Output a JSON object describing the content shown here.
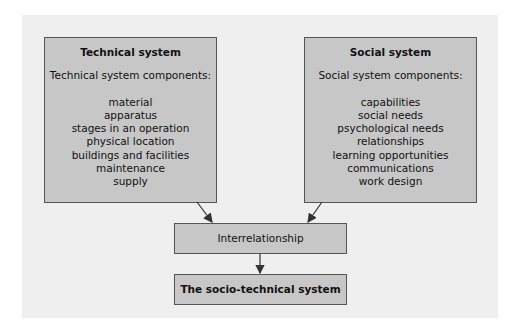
{
  "technical": {
    "title": "Technical system",
    "subtitle": "Technical system components:",
    "items": [
      "material",
      "apparatus",
      "stages in an operation",
      "physical location",
      "buildings and facilities",
      "maintenance",
      "supply"
    ]
  },
  "social": {
    "title": "Social system",
    "subtitle": "Social system components:",
    "items": [
      "capabilities",
      "social needs",
      "psychological needs",
      "relationships",
      "learning opportunities",
      "communications",
      "work design"
    ]
  },
  "interrelationship": {
    "label": "Interrelationship"
  },
  "result": {
    "label": "The socio-technical system"
  },
  "colors": {
    "box_fill": "#c7c7c7",
    "panel": "#efefef",
    "border": "#555555"
  }
}
